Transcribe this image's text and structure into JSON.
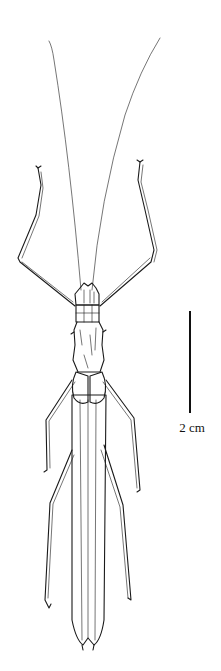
{
  "figure": {
    "colors": {
      "ink": "#1a1a1a",
      "background": "#ffffff"
    }
  },
  "scale_bar": {
    "label": "2 cm",
    "x": 190,
    "y_top": 311,
    "y_bottom": 413
  }
}
